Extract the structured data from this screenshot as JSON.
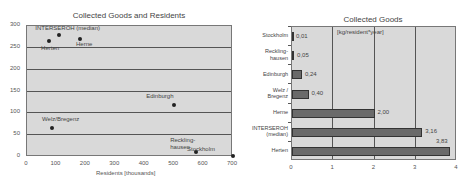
{
  "chart_data": [
    {
      "type": "scatter",
      "title": "Collected Goods and Residents",
      "xlabel": "Residents [thousands]",
      "ylabel": "",
      "xlim": [
        0,
        700
      ],
      "ylim": [
        0,
        300
      ],
      "xticks": [
        "0",
        "100",
        "200",
        "300",
        "400",
        "500",
        "600",
        "700"
      ],
      "yticks": [
        "0",
        "50",
        "100",
        "150",
        "200",
        "250",
        "300"
      ],
      "grid": "horizontal",
      "points": [
        {
          "label": "INTERSEROH (median)",
          "x": 110,
          "y": 280
        },
        {
          "label": "Herten",
          "x": 75,
          "y": 265
        },
        {
          "label": "Herne",
          "x": 180,
          "y": 270
        },
        {
          "label": "Edinburgh",
          "x": 500,
          "y": 118
        },
        {
          "label": "Welz/Bregenz",
          "x": 85,
          "y": 67
        },
        {
          "label": "Reckling-hausen",
          "x": 575,
          "y": 12
        },
        {
          "label": "Stockholm",
          "x": 700,
          "y": 2
        }
      ]
    },
    {
      "type": "bar",
      "orientation": "horizontal",
      "title": "Collected Goods",
      "unit_label": "[kg/resident*year]",
      "xlim": [
        0,
        4
      ],
      "xticks": [
        "0",
        "1",
        "2",
        "3",
        "4"
      ],
      "grid": "vertical",
      "categories": [
        "Stockholm",
        "Reckling-hausen",
        "Edinburgh",
        "Welz / Bregenz",
        "Herne",
        "INTERSEROH (median)",
        "Herten"
      ],
      "category_lines": [
        [
          "Stockholm"
        ],
        [
          "Reckling-",
          "hausen"
        ],
        [
          "Edinburgh"
        ],
        [
          "Welz /",
          "Bregenz"
        ],
        [
          "Herne"
        ],
        [
          "INTERSEROH",
          "(median)"
        ],
        [
          "Herten"
        ]
      ],
      "values": [
        0.01,
        0.05,
        0.24,
        0.4,
        2.0,
        3.16,
        3.83
      ],
      "value_labels": [
        "0,01",
        "0,05",
        "0,24",
        "0,40",
        "2,00",
        "3,16",
        "3,83"
      ]
    }
  ]
}
